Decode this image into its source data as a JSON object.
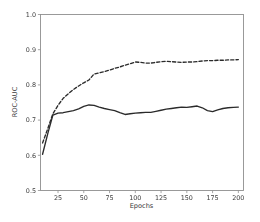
{
  "figure": {
    "background_color": "#ffffff",
    "axis_color": "#8f8f8f",
    "text_color": "#3a3a3a"
  },
  "chart_data": {
    "type": "line",
    "title": "",
    "xlabel": "Epochs",
    "ylabel": "ROC-AUC",
    "xlim": [
      8,
      205
    ],
    "ylim": [
      0.5,
      1.0
    ],
    "grid": false,
    "legend": "none",
    "xticks": [
      25,
      50,
      75,
      100,
      125,
      150,
      175,
      200
    ],
    "xtick_labels": [
      "25",
      "50",
      "75",
      "100",
      "125",
      "150",
      "175",
      "200"
    ],
    "yticks": [
      0.5,
      0.6,
      0.7,
      0.8,
      0.9,
      1.0
    ],
    "ytick_labels": [
      "0.5",
      "0.6",
      "0.7",
      "0.8",
      "0.9",
      "1.0"
    ],
    "series": [
      {
        "name": "validation-roc-auc",
        "style": "dashed",
        "color": "#2b2b2b",
        "x": [
          10,
          15,
          20,
          25,
          30,
          35,
          40,
          45,
          50,
          55,
          60,
          65,
          70,
          75,
          80,
          85,
          90,
          95,
          100,
          105,
          110,
          115,
          120,
          125,
          130,
          135,
          140,
          145,
          150,
          155,
          160,
          165,
          170,
          175,
          180,
          185,
          190,
          195,
          200
        ],
        "y": [
          0.635,
          0.675,
          0.718,
          0.742,
          0.762,
          0.775,
          0.787,
          0.797,
          0.806,
          0.814,
          0.831,
          0.834,
          0.838,
          0.842,
          0.847,
          0.851,
          0.856,
          0.86,
          0.865,
          0.864,
          0.862,
          0.862,
          0.864,
          0.866,
          0.867,
          0.866,
          0.865,
          0.864,
          0.865,
          0.865,
          0.866,
          0.868,
          0.869,
          0.869,
          0.87,
          0.87,
          0.871,
          0.871,
          0.872
        ]
      },
      {
        "name": "training-roc-auc",
        "style": "solid",
        "color": "#2b2b2b",
        "x": [
          10,
          15,
          20,
          25,
          30,
          35,
          40,
          45,
          50,
          55,
          60,
          65,
          70,
          75,
          80,
          85,
          90,
          95,
          100,
          105,
          110,
          115,
          120,
          125,
          130,
          135,
          140,
          145,
          150,
          155,
          160,
          165,
          170,
          175,
          180,
          185,
          190,
          195,
          200
        ],
        "y": [
          0.603,
          0.661,
          0.714,
          0.72,
          0.721,
          0.724,
          0.727,
          0.732,
          0.739,
          0.743,
          0.742,
          0.737,
          0.733,
          0.73,
          0.727,
          0.721,
          0.716,
          0.718,
          0.72,
          0.721,
          0.722,
          0.722,
          0.725,
          0.728,
          0.731,
          0.733,
          0.735,
          0.737,
          0.736,
          0.738,
          0.74,
          0.735,
          0.727,
          0.724,
          0.729,
          0.733,
          0.735,
          0.736,
          0.737
        ]
      }
    ]
  }
}
